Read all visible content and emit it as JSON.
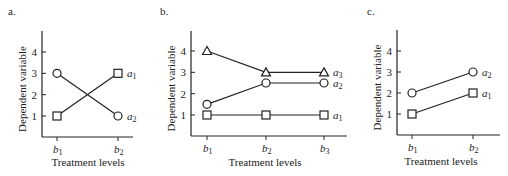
{
  "chart_data": [
    {
      "type": "line",
      "panel_label": "a.",
      "xlabel": "Treatment levels",
      "ylabel": "Dependent variable",
      "categories": [
        "b1",
        "b2"
      ],
      "yticks": [
        1,
        2,
        3,
        4
      ],
      "ylim": [
        0,
        5
      ],
      "grid": false,
      "series": [
        {
          "name": "a1",
          "marker": "square",
          "values": [
            1,
            3
          ]
        },
        {
          "name": "a2",
          "marker": "circle",
          "values": [
            3,
            1
          ]
        }
      ]
    },
    {
      "type": "line",
      "panel_label": "b.",
      "xlabel": "Treatment levels",
      "ylabel": "Dependent variable",
      "categories": [
        "b1",
        "b2",
        "b3"
      ],
      "yticks": [
        1,
        2,
        3,
        4
      ],
      "ylim": [
        0,
        5
      ],
      "grid": false,
      "series": [
        {
          "name": "a1",
          "marker": "square",
          "values": [
            1,
            1,
            1
          ]
        },
        {
          "name": "a2",
          "marker": "circle",
          "values": [
            1.5,
            2.5,
            2.5
          ]
        },
        {
          "name": "a3",
          "marker": "triangle",
          "values": [
            4,
            3,
            3
          ]
        }
      ]
    },
    {
      "type": "line",
      "panel_label": "c.",
      "xlabel": "Treatment levels",
      "ylabel": "Dependent variable",
      "categories": [
        "b1",
        "b2"
      ],
      "yticks": [
        1,
        2,
        3,
        4
      ],
      "ylim": [
        0,
        5
      ],
      "grid": false,
      "series": [
        {
          "name": "a1",
          "marker": "square",
          "values": [
            1,
            2
          ]
        },
        {
          "name": "a2",
          "marker": "circle",
          "values": [
            2,
            3
          ]
        }
      ]
    }
  ],
  "panels": [
    {
      "label": "a.",
      "xlabel": "Treatment levels",
      "ylabel": "Dependent variable"
    },
    {
      "label": "b.",
      "xlabel": "Treatment levels",
      "ylabel": "Dependent variable"
    },
    {
      "label": "c.",
      "xlabel": "Treatment levels",
      "ylabel": "Dependent variable"
    }
  ]
}
